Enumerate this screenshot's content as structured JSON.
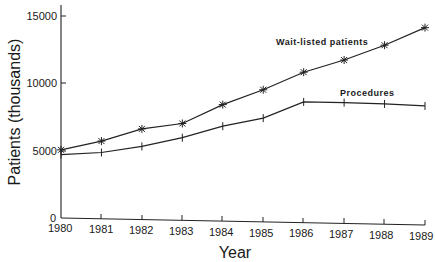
{
  "chart_data": {
    "type": "line",
    "title": "",
    "xlabel": "Year",
    "ylabel": "Patients (thousands)",
    "x": [
      1980,
      1981,
      1982,
      1983,
      1984,
      1985,
      1986,
      1987,
      1988,
      1989
    ],
    "xticks": [
      "1980",
      "1981",
      "1982",
      "1983",
      "1984",
      "1985",
      "1986",
      "1987",
      "1988",
      "1989"
    ],
    "yticks": [
      "0",
      "5000",
      "10000",
      "15000"
    ],
    "ylim": [
      0,
      16000
    ],
    "grid": false,
    "legend": "inline labels",
    "series": [
      {
        "name": "Wait-listed patients",
        "marker": "asterisk",
        "values": [
          5050,
          5700,
          6600,
          7000,
          8400,
          9500,
          10800,
          11700,
          12800,
          14100
        ]
      },
      {
        "name": "Procedures",
        "marker": "plus",
        "values": [
          4700,
          4850,
          5300,
          5950,
          6800,
          7400,
          8600,
          8550,
          8450,
          8300
        ]
      }
    ]
  },
  "labels": {
    "ylabel": "Patients (thousands)",
    "xlabel": "Year",
    "series0": "Wait-listed patients",
    "series1": "Procedures",
    "ytick0": "0",
    "ytick1": "5000",
    "ytick2": "10000",
    "ytick3": "15000",
    "xtick0": "1980",
    "xtick1": "1981",
    "xtick2": "1982",
    "xtick3": "1983",
    "xtick4": "1984",
    "xtick5": "1985",
    "xtick6": "1986",
    "xtick7": "1987",
    "xtick8": "1988",
    "xtick9": "1989"
  }
}
